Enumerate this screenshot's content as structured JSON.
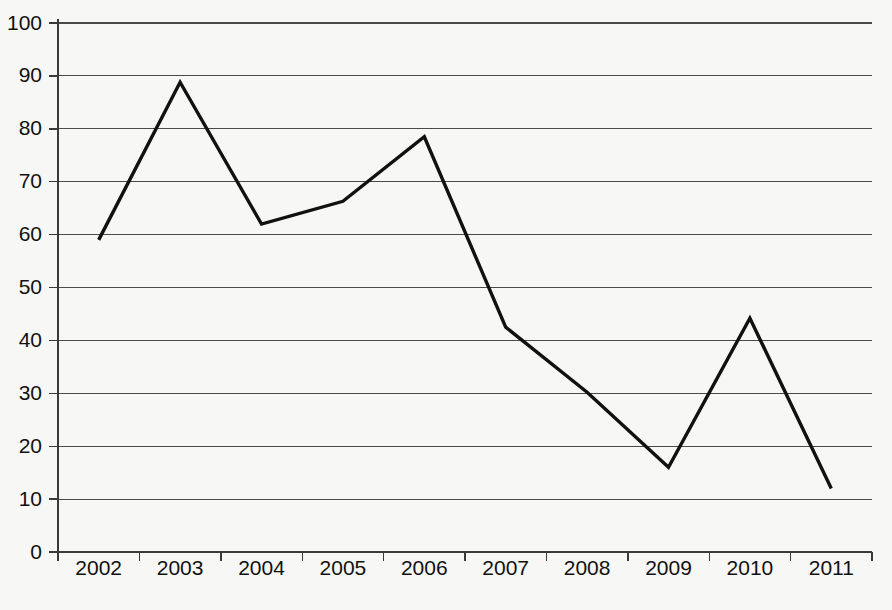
{
  "chart_data": {
    "type": "line",
    "title": "",
    "subtitle": "",
    "xlabel": "",
    "ylabel": "",
    "categories": [
      "2002",
      "2003",
      "2004",
      "2005",
      "2006",
      "2007",
      "2008",
      "2009",
      "2010",
      "2011"
    ],
    "values": [
      59,
      88.8,
      62,
      66.3,
      78.5,
      42.5,
      30.2,
      16,
      44.2,
      12
    ],
    "series": [
      {
        "name": "",
        "values": [
          59,
          88.8,
          62,
          66.3,
          78.5,
          42.5,
          30.2,
          16,
          44.2,
          12
        ]
      }
    ],
    "ylim": [
      0,
      100
    ],
    "ytick_values": [
      0,
      10,
      20,
      30,
      40,
      50,
      60,
      70,
      80,
      90,
      100
    ],
    "ytick_labels": [
      "0",
      "10",
      "20",
      "30",
      "40",
      "50",
      "60",
      "70",
      "80",
      "90",
      "100"
    ],
    "xtick_labels": [
      "2002",
      "2003",
      "2004",
      "2005",
      "2006",
      "2007",
      "2008",
      "2009",
      "2010",
      "2011"
    ],
    "grid": true,
    "grid_axis": "y",
    "legend": false,
    "legend_position": "none",
    "line_color": "#111111",
    "grid_color": "#4a4a4a",
    "axis_color": "#3a3a3a",
    "background_color": "#f7f7f5",
    "markers": false,
    "annotations": []
  },
  "layout": {
    "plot_left": 58,
    "plot_right": 872,
    "plot_top": 23,
    "plot_bottom": 552,
    "xlabel_baseline": 560
  }
}
